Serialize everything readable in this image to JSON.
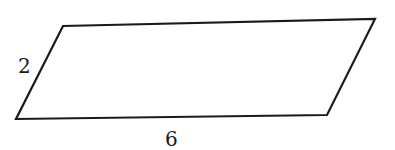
{
  "diagram": {
    "shape": "parallelogram",
    "vertices": {
      "top_left": [
        63,
        26
      ],
      "top_right": [
        375,
        19
      ],
      "bottom_right": [
        327,
        115
      ],
      "bottom_left": [
        16,
        119
      ]
    },
    "labels": {
      "side": "2",
      "base": "6"
    },
    "stroke_color": "#1a1a1a",
    "background_color": "#ffffff"
  }
}
